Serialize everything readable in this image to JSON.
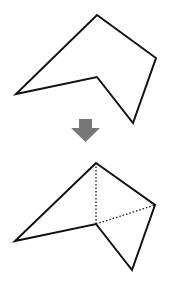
{
  "diagram": {
    "colors": {
      "stroke": "#111111",
      "arrow": "#777777",
      "background": "#ffffff"
    },
    "top_polygon": {
      "points": "97,15 156,58 133,123 97,77 16,94"
    },
    "arrow": {
      "direction": "down",
      "points": "79,119 92,119 92,128 100,128 85.5,142 71,128 79,128"
    },
    "bottom_polygon": {
      "points": "96,163 155,205 132,270 96,224 15,241",
      "diagonals": [
        {
          "x1": 96,
          "y1": 163,
          "x2": 96,
          "y2": 224
        },
        {
          "x1": 96,
          "y1": 224,
          "x2": 155,
          "y2": 205
        }
      ]
    }
  }
}
